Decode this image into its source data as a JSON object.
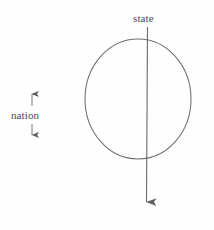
{
  "diagram": {
    "type": "schematic-circle-with-axis",
    "title_visible": false,
    "background_color": "#fefefe",
    "stroke_color": "#6b6b6b",
    "text_color": "#4a4a4a",
    "labels": {
      "state": "state",
      "nation": "nation"
    },
    "icons": {
      "down_arrow": "down-arrow-icon",
      "up_arrow": "up-arrow-icon",
      "circle": "circle-outline-icon"
    },
    "geometry": {
      "circle": {
        "center_x": 138,
        "center_y": 99,
        "radius_x": 53,
        "radius_y": 60
      },
      "state_axis": {
        "x": 147,
        "y_start": 27,
        "y_end": 212
      },
      "nation_marker": {
        "x": 32,
        "up_arrow_top": 92,
        "up_arrow_bottom": 106,
        "down_arrow_top": 124,
        "down_arrow_bottom": 137
      }
    }
  }
}
